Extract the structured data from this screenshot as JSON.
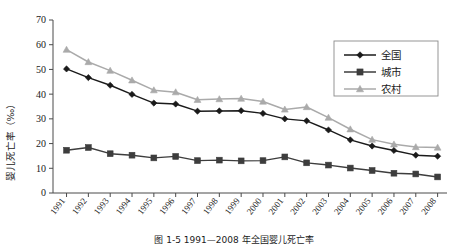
{
  "figure": {
    "caption": "图 1-5  1991—2008 年全国婴儿死亡率"
  },
  "chart_data": {
    "type": "line",
    "title": "",
    "xlabel": "",
    "ylabel": "婴儿死亡率（‰）",
    "ylim": [
      0,
      70
    ],
    "ytick_values": [
      0,
      10,
      20,
      30,
      40,
      50,
      60,
      70
    ],
    "ytick_labels": [
      "0",
      "10",
      "20",
      "30",
      "40",
      "50",
      "60",
      "70"
    ],
    "grid": false,
    "legend_position": "top-right",
    "categories": [
      "1991",
      "1992",
      "1993",
      "1994",
      "1995",
      "1996",
      "1997",
      "1998",
      "1999",
      "2000",
      "2001",
      "2002",
      "2003",
      "2004",
      "2005",
      "2006",
      "2007",
      "2008"
    ],
    "series": [
      {
        "name": "全国",
        "marker": "diamond",
        "color": "#1a1a1a",
        "values": [
          50.2,
          46.7,
          43.6,
          39.9,
          36.4,
          36.0,
          33.1,
          33.2,
          33.3,
          32.2,
          30.0,
          29.2,
          25.5,
          21.5,
          19.0,
          17.2,
          15.3,
          14.9
        ]
      },
      {
        "name": "城市",
        "marker": "square",
        "color": "#3d3d3d",
        "values": [
          17.3,
          18.4,
          15.9,
          15.3,
          14.2,
          14.8,
          13.1,
          13.3,
          13.0,
          13.1,
          14.6,
          12.2,
          11.3,
          10.1,
          9.1,
          8.0,
          7.7,
          6.5
        ]
      },
      {
        "name": "农村",
        "marker": "triangle",
        "color": "#aaaaaa",
        "values": [
          58.0,
          53.0,
          49.5,
          45.6,
          41.6,
          40.8,
          37.7,
          38.0,
          38.2,
          37.0,
          33.8,
          34.8,
          30.5,
          25.8,
          21.6,
          19.7,
          18.6,
          18.4
        ]
      }
    ]
  }
}
